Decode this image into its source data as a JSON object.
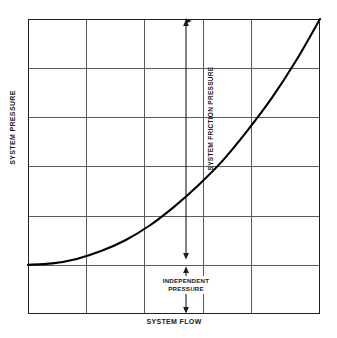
{
  "figure": {
    "background_color": "#ffffff",
    "frame_color": "#231f20",
    "grid_color": "#5a5a5c",
    "curve_color": "#000000",
    "annotation_color": "#1a1a1a"
  },
  "axes": {
    "y_label": "SYSTEM PRESSURE",
    "x_label": "SYSTEM FLOW"
  },
  "annotations": {
    "friction_label": "SYSTEM FRICTION PRESSURE",
    "independent_label_line1": "INDEPENDENT",
    "independent_label_line2": "PRESSURE"
  },
  "chart_data": {
    "type": "line",
    "title": "",
    "subtitle": "",
    "xlabel": "SYSTEM FLOW",
    "ylabel": "SYSTEM PRESSURE",
    "xlim": [
      0,
      6
    ],
    "ylim": [
      0,
      6
    ],
    "x_tick_labels": [],
    "y_tick_labels": [],
    "grid": true,
    "grid_columns": 6,
    "grid_rows": 6,
    "legend": null,
    "series": [
      {
        "name": "system curve",
        "comment": "Pump/system head curve: constant independent pressure offset plus friction loss rising with the square of flow.",
        "x": [
          0.0,
          0.5,
          1.0,
          1.5,
          2.0,
          2.5,
          3.0,
          3.5,
          4.0,
          4.5,
          5.0,
          5.5,
          6.0
        ],
        "y": [
          1.0,
          1.03,
          1.12,
          1.28,
          1.5,
          1.8,
          2.18,
          2.62,
          3.12,
          3.72,
          4.38,
          5.14,
          6.0
        ]
      }
    ],
    "annotations": [
      {
        "label": "SYSTEM FRICTION PRESSURE",
        "type": "double-arrow-vertical",
        "x": 3.25,
        "y_from": 2.33,
        "y_to": 6.0,
        "orientation": "vertical",
        "text_rotation": -90
      },
      {
        "label": "INDEPENDENT PRESSURE",
        "type": "double-arrow-vertical",
        "x": 3.25,
        "y_from": 0.0,
        "y_to": 2.23,
        "orientation": "vertical",
        "text_rotation": 0
      }
    ]
  }
}
